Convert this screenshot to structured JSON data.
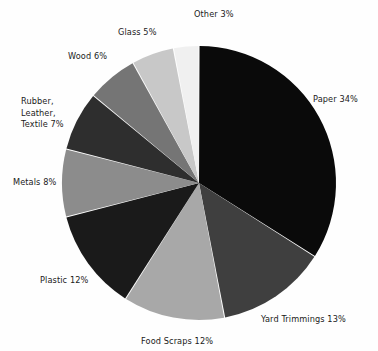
{
  "chart_data": {
    "type": "pie",
    "title": "",
    "subtitle": "",
    "xlabel": "",
    "ylabel": "",
    "legend_position": "none",
    "grid": false,
    "units": "percent",
    "total": 100,
    "start_angle_deg": 0,
    "direction": "clockwise",
    "categories": [
      "Paper",
      "Yard Trimmings",
      "Food Scraps",
      "Plastic",
      "Metals",
      "Rubber, Leather, Textile",
      "Wood",
      "Glass",
      "Other"
    ],
    "values": [
      34,
      13,
      12,
      12,
      8,
      7,
      6,
      5,
      3
    ],
    "colors": [
      "#0a0a0a",
      "#3f3f3f",
      "#a8a8a8",
      "#1a1a1a",
      "#8c8c8c",
      "#2e2e2e",
      "#757575",
      "#c8c8c8",
      "#f0f0f0"
    ],
    "slices": [
      {
        "name": "Paper",
        "value": 34,
        "label": "Paper 34%",
        "color": "#0a0a0a"
      },
      {
        "name": "Yard Trimmings",
        "value": 13,
        "label": "Yard Trimmings 13%",
        "color": "#3f3f3f"
      },
      {
        "name": "Food Scraps",
        "value": 12,
        "label": "Food Scraps 12%",
        "color": "#a8a8a8"
      },
      {
        "name": "Plastic",
        "value": 12,
        "label": "Plastic 12%",
        "color": "#1a1a1a"
      },
      {
        "name": "Metals",
        "value": 8,
        "label": "Metals 8%",
        "color": "#8c8c8c"
      },
      {
        "name": "Rubber, Leather, Textile",
        "value": 7,
        "label": "Rubber,\nLeather,\nTextile 7%",
        "color": "#2e2e2e"
      },
      {
        "name": "Wood",
        "value": 6,
        "label": "Wood 6%",
        "color": "#757575"
      },
      {
        "name": "Glass",
        "value": 5,
        "label": "Glass 5%",
        "color": "#c8c8c8"
      },
      {
        "name": "Other",
        "value": 3,
        "label": "Other 3%",
        "color": "#f0f0f0"
      }
    ]
  },
  "geometry": {
    "center_x": 199,
    "center_y": 183,
    "radius": 137
  },
  "labels": {
    "paper": "Paper 34%",
    "yard_trimmings": "Yard Trimmings 13%",
    "food_scraps": "Food Scraps 12%",
    "plastic": "Plastic 12%",
    "metals": "Metals 8%",
    "rubber_leather_textile": "Rubber,\nLeather,\nTextile 7%",
    "wood": "Wood 6%",
    "glass": "Glass 5%",
    "other": "Other 3%"
  }
}
